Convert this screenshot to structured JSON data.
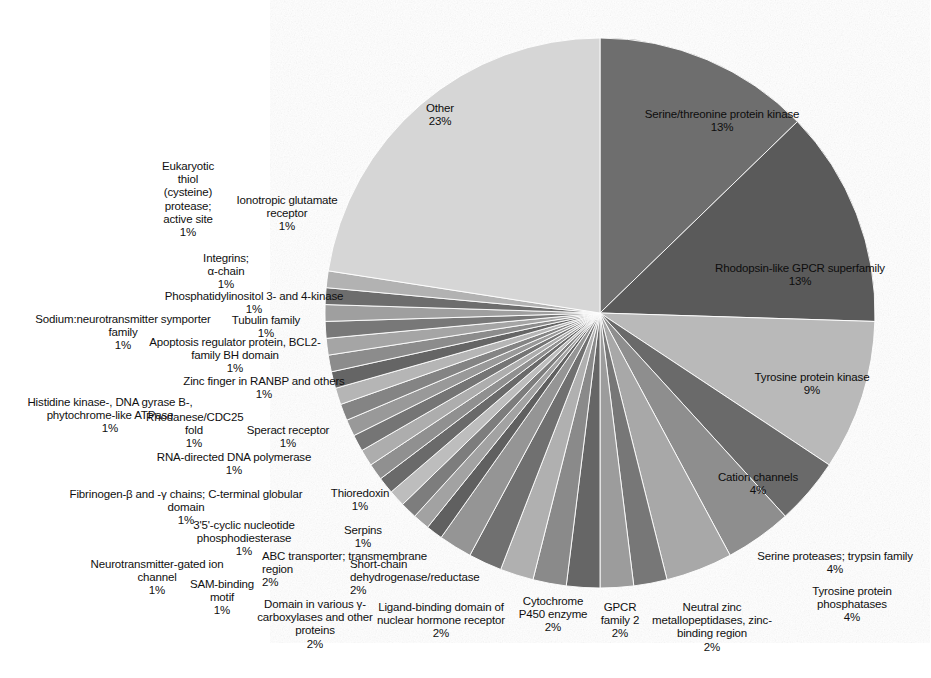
{
  "chart_data": {
    "type": "pie",
    "title": "",
    "subtitle": "",
    "xlabel": "",
    "ylabel": "",
    "legend_position": "none",
    "labels_show_percent": true,
    "start_angle_deg": 0,
    "direction": "clockwise",
    "categories": [
      "Serine/threonine protein kinase",
      "Rhodopsin-like GPCR superfamily",
      "Tyrosine protein kinase",
      "Cation channels",
      "Serine proteases; trypsin family",
      "Tyrosine protein phosphatases",
      "Neutral zinc metallopeptidases, zinc-binding region",
      "GPCR family 2",
      "Cytochrome P450 enzyme",
      "Ligand-binding domain of nuclear hormone receptor",
      "Domain in various γ-carboxylases and other proteins",
      "Short-chain dehydrogenase/reductase",
      "ABC transporter; transmembrane region",
      "SAM-binding motif",
      "Neurotransmitter-gated ion channel",
      "Serpins",
      "3'5'-cyclic nucleotide phosphodiesterase",
      "Thioredoxin",
      "Fibrinogen-β and -γ chains; C-terminal globular domain",
      "RNA-directed DNA polymerase",
      "Speract receptor",
      "Rhodanese/CDC25 fold",
      "Histidine kinase-, DNA gyrase B-, phytochrome-like ATPase",
      "Zinc finger in RANBP and others",
      "Apoptosis regulator protein, BCL2-family BH domain",
      "Tubulin family",
      "Sodium:neurotransmitter symporter family",
      "Phosphatidylinositol 3- and 4-kinase",
      "Integrins; α-chain",
      "Ionotropic glutamate receptor",
      "Eukaryotic thiol (cysteine) protease; active site",
      "Other"
    ],
    "values": [
      13,
      13,
      9,
      4,
      4,
      4,
      2,
      2,
      2,
      2,
      2,
      2,
      2,
      1,
      1,
      1,
      1,
      1,
      1,
      1,
      1,
      1,
      1,
      1,
      1,
      1,
      1,
      1,
      1,
      1,
      1,
      23
    ],
    "value_unit": "%",
    "colors": [
      "#6e6e6e",
      "#5a5a5a",
      "#b9b9b9",
      "#6b6b6b",
      "#8e8e8e",
      "#a8a8a8",
      "#777777",
      "#9c9c9c",
      "#666666",
      "#8a8a8a",
      "#b0b0b0",
      "#707070",
      "#959595",
      "#606060",
      "#a2a2a2",
      "#7d7d7d",
      "#bdbdbd",
      "#6a6a6a",
      "#909090",
      "#adadad",
      "#747474",
      "#999999",
      "#848484",
      "#b5b5b5",
      "#656565",
      "#8c8c8c",
      "#a5a5a5",
      "#787878",
      "#9f9f9f",
      "#6d6d6d",
      "#b2b2b2",
      "#d6d6d6"
    ],
    "total": 100
  },
  "slice_labels": [
    {
      "name": "serine-threonine-protein-kinase",
      "text": "Serine/threonine protein kinase",
      "pct": "13%",
      "placement": "inside"
    },
    {
      "name": "rhodopsin-like-gpcr-superfamily",
      "text": "Rhodopsin-like GPCR superfamily",
      "pct": "13%",
      "placement": "inside"
    },
    {
      "name": "tyrosine-protein-kinase",
      "text": "Tyrosine protein kinase",
      "pct": "9%",
      "placement": "inside"
    },
    {
      "name": "cation-channels",
      "text": "Cation channels",
      "pct": "4%",
      "placement": "inside"
    },
    {
      "name": "serine-proteases-trypsin-family",
      "text": "Serine proteases; trypsin family",
      "pct": "4%",
      "placement": "outside"
    },
    {
      "name": "tyrosine-protein-phosphatases",
      "text": "Tyrosine protein phosphatases",
      "pct": "4%",
      "placement": "outside"
    },
    {
      "name": "neutral-zinc-metallopeptidases",
      "text": "Neutral zinc metallopeptidases, zinc-binding region",
      "pct": "2%",
      "placement": "outside"
    },
    {
      "name": "gpcr-family-2",
      "text": "GPCR family 2",
      "pct": "2%",
      "placement": "outside"
    },
    {
      "name": "cytochrome-p450-enzyme",
      "text": "Cytochrome P450 enzyme",
      "pct": "2%",
      "placement": "outside"
    },
    {
      "name": "ligand-binding-domain-nuclear-hormone-receptor",
      "text": "Ligand-binding domain of nuclear hormone receptor",
      "pct": "2%",
      "placement": "outside"
    },
    {
      "name": "domain-gamma-carboxylases",
      "text": "Domain in various γ-carboxylases and other proteins",
      "pct": "2%",
      "placement": "outside"
    },
    {
      "name": "short-chain-dehydrogenase-reductase",
      "text": "Short-chain dehydrogenase/reductase",
      "pct": "2%",
      "placement": "outside"
    },
    {
      "name": "abc-transporter-transmembrane-region",
      "text": "ABC transporter; transmembrane region",
      "pct": "2%",
      "placement": "outside"
    },
    {
      "name": "sam-binding-motif",
      "text": "SAM-binding motif",
      "pct": "1%",
      "placement": "outside"
    },
    {
      "name": "neurotransmitter-gated-ion-channel",
      "text": "Neurotransmitter-gated ion channel",
      "pct": "1%",
      "placement": "outside"
    },
    {
      "name": "serpins",
      "text": "Serpins",
      "pct": "1%",
      "placement": "outside"
    },
    {
      "name": "cyclic-nucleotide-phosphodiesterase",
      "text": "3'5'-cyclic nucleotide phosphodiesterase",
      "pct": "1%",
      "placement": "outside"
    },
    {
      "name": "thioredoxin",
      "text": "Thioredoxin",
      "pct": "1%",
      "placement": "outside"
    },
    {
      "name": "fibrinogen-beta-gamma-chains",
      "text": "Fibrinogen-β and -γ chains; C-terminal globular domain",
      "pct": "1%",
      "placement": "outside"
    },
    {
      "name": "rna-directed-dna-polymerase",
      "text": "RNA-directed DNA polymerase",
      "pct": "1%",
      "placement": "outside"
    },
    {
      "name": "speract-receptor",
      "text": "Speract receptor",
      "pct": "1%",
      "placement": "outside"
    },
    {
      "name": "rhodanese-cdc25-fold",
      "text": "Rhodanese/CDC25 fold",
      "pct": "1%",
      "placement": "outside"
    },
    {
      "name": "histidine-kinase-dna-gyrase-b-phytochrome-like-atpase",
      "text": "Histidine kinase-, DNA gyrase B-, phytochrome-like ATPase",
      "pct": "1%",
      "placement": "outside"
    },
    {
      "name": "zinc-finger-in-ranbp-and-others",
      "text": "Zinc finger in RANBP and others",
      "pct": "1%",
      "placement": "outside"
    },
    {
      "name": "apoptosis-regulator-protein-bcl2",
      "text": "Apoptosis regulator protein, BCL2-family BH domain",
      "pct": "1%",
      "placement": "outside"
    },
    {
      "name": "tubulin-family",
      "text": "Tubulin family",
      "pct": "1%",
      "placement": "outside"
    },
    {
      "name": "sodium-neurotransmitter-symporter-family",
      "text": "Sodium:neurotransmitter symporter family",
      "pct": "1%",
      "placement": "outside"
    },
    {
      "name": "phosphatidylinositol-3-and-4-kinase",
      "text": "Phosphatidylinositol 3- and 4-kinase",
      "pct": "1%",
      "placement": "outside"
    },
    {
      "name": "integrins-alpha-chain",
      "text": "Integrins; α-chain",
      "pct": "1%",
      "placement": "outside"
    },
    {
      "name": "ionotropic-glutamate-receptor",
      "text": "Ionotropic glutamate receptor",
      "pct": "1%",
      "placement": "outside"
    },
    {
      "name": "eukaryotic-thiol-cysteine-protease-active-site",
      "text": "Eukaryotic thiol (cysteine) protease; active site",
      "pct": "1%",
      "placement": "outside"
    },
    {
      "name": "other",
      "text": "Other",
      "pct": "23%",
      "placement": "inside"
    }
  ],
  "geometry": {
    "center_x": 600,
    "center_y": 313,
    "radius": 275
  }
}
